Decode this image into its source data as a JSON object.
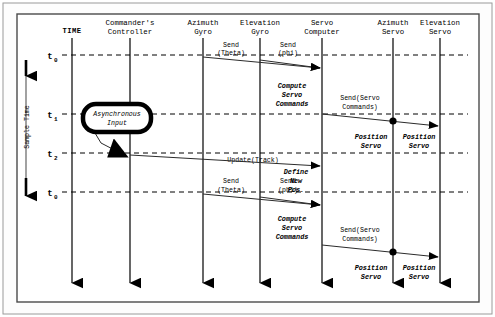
{
  "diagram": {
    "time_axis": {
      "header": "TIME",
      "side_label": "Sample Time",
      "ticks": [
        {
          "label": "t",
          "sub": "0",
          "y": 55
        },
        {
          "label": "t",
          "sub": "1",
          "y": 114
        },
        {
          "label": "t",
          "sub": "2",
          "y": 153
        },
        {
          "label": "t",
          "sub": "0",
          "y": 192
        }
      ]
    },
    "lifelines": [
      {
        "name": "time",
        "line1": "TIME",
        "line2": "",
        "x": 72,
        "is_header_bold": true
      },
      {
        "name": "commanders-controller",
        "line1": "Commander's",
        "line2": "Controller",
        "x": 130
      },
      {
        "name": "azimuth-gyro",
        "line1": "Azimuth",
        "line2": "Gyro",
        "x": 203
      },
      {
        "name": "elevation-gyro",
        "line1": "Elevation",
        "line2": "Gyro",
        "x": 260
      },
      {
        "name": "servo-computer",
        "line1": "Servo",
        "line2": "Computer",
        "x": 322
      },
      {
        "name": "azimuth-servo",
        "line1": "Azimuth",
        "line2": "Servo",
        "x": 393
      },
      {
        "name": "elevation-servo",
        "line1": "Elevation",
        "line2": "Servo",
        "x": 440
      }
    ],
    "messages": [
      {
        "name": "send-theta-1",
        "line1": "Send",
        "line2": "(Theta)",
        "label_x": 231,
        "label_y": 47,
        "x1": 203,
        "y1": 57,
        "x2": 320,
        "y2": 68
      },
      {
        "name": "send-phi-1",
        "line1": "Send",
        "line2": "(phi)",
        "label_x": 288,
        "label_y": 47,
        "x1": 260,
        "y1": 57,
        "x2": 320,
        "y2": 68
      },
      {
        "name": "send-servo-commands-1",
        "line1": "Send(Servo",
        "line2": "Commands)",
        "label_x": 360,
        "label_y": 96,
        "x1": 322,
        "y1": 114,
        "x2": 438,
        "y2": 126
      },
      {
        "name": "update-track",
        "line1": "Update(Track)",
        "line2": "",
        "label_x": 253,
        "label_y": 159,
        "x1": 130,
        "y1": 155,
        "x2": 320,
        "y2": 166
      },
      {
        "name": "send-theta-2",
        "line1": "Send",
        "line2": "(Theta)",
        "label_x": 231,
        "label_y": 181,
        "x1": 203,
        "y1": 192,
        "x2": 320,
        "y2": 203
      },
      {
        "name": "send-phi-2",
        "line1": "Send",
        "line2": "(phi)",
        "label_x": 288,
        "label_y": 181,
        "x1": 260,
        "y1": 192,
        "x2": 320,
        "y2": 203
      },
      {
        "name": "send-servo-commands-2",
        "line1": "Send(Servo",
        "line2": "Commands)",
        "label_x": 360,
        "label_y": 230,
        "x1": 322,
        "y1": 245,
        "x2": 438,
        "y2": 257
      }
    ],
    "actions": [
      {
        "name": "compute-servo-commands-1",
        "lines": [
          "Compute",
          "Servo",
          "Commands"
        ],
        "x": 292,
        "y": 85
      },
      {
        "name": "position-servo-azimuth-1",
        "lines": [
          "Position",
          "Servo"
        ],
        "x": 371,
        "y": 136
      },
      {
        "name": "position-servo-elevation-1",
        "lines": [
          "Position",
          "Servo"
        ],
        "x": 419,
        "y": 136
      },
      {
        "name": "define-new-pos",
        "lines": [
          "Define",
          "New",
          "Pos."
        ],
        "x": 296,
        "y": 171
      },
      {
        "name": "compute-servo-commands-2",
        "lines": [
          "Compute",
          "Servo",
          "Commands"
        ],
        "x": 292,
        "y": 217
      },
      {
        "name": "position-servo-azimuth-2",
        "lines": [
          "Position",
          "Servo"
        ],
        "x": 371,
        "y": 267
      },
      {
        "name": "position-servo-elevation-2",
        "lines": [
          "Position",
          "Servo"
        ],
        "x": 419,
        "y": 267
      }
    ],
    "async_input": {
      "name": "asynchronous-input",
      "line1": "Asynchronous",
      "line2": "Input",
      "x": 83,
      "y": 104,
      "width": 68,
      "height": 28,
      "arrow": {
        "x1": 95,
        "y1": 133,
        "bend_x": 101,
        "bend_y": 142,
        "x2": 131,
        "y2": 157
      }
    },
    "dots": [
      {
        "name": "azimuth-servo-receive-1",
        "x": 393,
        "y": 121
      },
      {
        "name": "azimuth-servo-receive-2",
        "x": 393,
        "y": 252
      }
    ],
    "colors": {
      "line": "#000000",
      "message": "#2b2b2b",
      "frame": "#4a4a4a",
      "background": "#ffffff"
    }
  }
}
